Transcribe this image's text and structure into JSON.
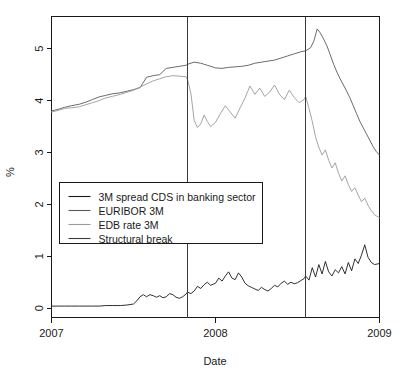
{
  "chart_data": {
    "type": "line",
    "title": "",
    "xlabel": "Date",
    "ylabel": "%",
    "xlim": [
      2007.0,
      2009.0
    ],
    "ylim": [
      -0.18,
      5.62
    ],
    "grid": false,
    "legend_position": "center-left",
    "x_tick_labels": [
      "2007",
      "2008",
      "2009"
    ],
    "x_tick_values": [
      2007,
      2008,
      2009
    ],
    "y_tick_labels": [
      "0",
      "1",
      "2",
      "3",
      "4",
      "5"
    ],
    "y_tick_values": [
      0,
      1,
      2,
      3,
      4,
      5
    ],
    "colors": {
      "cds": "#1a1a1a",
      "euribor": "#5a5a5a",
      "edb": "#9a9a9a",
      "break": "#3c3c3c",
      "axis": "#1a1a1a",
      "background": "#ffffff"
    },
    "annotations": [
      {
        "name": "structural-break-1",
        "x": 2007.83,
        "label": "Structural break"
      },
      {
        "name": "structural-break-2",
        "x": 2008.55,
        "label": "Structural break"
      }
    ],
    "series": [
      {
        "name": "3M spread CDS in banking sector",
        "key": "cds",
        "x": [
          2007.0,
          2007.04,
          2007.08,
          2007.12,
          2007.17,
          2007.21,
          2007.25,
          2007.29,
          2007.33,
          2007.37,
          2007.42,
          2007.46,
          2007.5,
          2007.52,
          2007.54,
          2007.56,
          2007.58,
          2007.6,
          2007.62,
          2007.64,
          2007.66,
          2007.68,
          2007.7,
          2007.72,
          2007.74,
          2007.76,
          2007.78,
          2007.8,
          2007.82,
          2007.83,
          2007.85,
          2007.87,
          2007.89,
          2007.91,
          2007.93,
          2007.95,
          2007.97,
          2008.0,
          2008.02,
          2008.04,
          2008.06,
          2008.08,
          2008.1,
          2008.12,
          2008.14,
          2008.16,
          2008.18,
          2008.2,
          2008.22,
          2008.24,
          2008.26,
          2008.28,
          2008.3,
          2008.32,
          2008.34,
          2008.36,
          2008.38,
          2008.4,
          2008.42,
          2008.44,
          2008.46,
          2008.48,
          2008.5,
          2008.52,
          2008.54,
          2008.55,
          2008.57,
          2008.59,
          2008.61,
          2008.63,
          2008.65,
          2008.67,
          2008.69,
          2008.71,
          2008.73,
          2008.75,
          2008.77,
          2008.79,
          2008.81,
          2008.83,
          2008.85,
          2008.87,
          2008.89,
          2008.91,
          2008.93,
          2008.95,
          2008.97,
          2009.0
        ],
        "values": [
          0.04,
          0.04,
          0.04,
          0.04,
          0.04,
          0.04,
          0.04,
          0.04,
          0.05,
          0.05,
          0.05,
          0.06,
          0.08,
          0.14,
          0.22,
          0.26,
          0.22,
          0.26,
          0.24,
          0.21,
          0.24,
          0.2,
          0.22,
          0.28,
          0.26,
          0.21,
          0.19,
          0.22,
          0.27,
          0.31,
          0.28,
          0.33,
          0.42,
          0.38,
          0.45,
          0.5,
          0.44,
          0.48,
          0.58,
          0.52,
          0.62,
          0.7,
          0.58,
          0.55,
          0.68,
          0.6,
          0.48,
          0.43,
          0.4,
          0.37,
          0.34,
          0.4,
          0.36,
          0.33,
          0.38,
          0.44,
          0.41,
          0.48,
          0.52,
          0.46,
          0.5,
          0.47,
          0.49,
          0.53,
          0.57,
          0.62,
          0.54,
          0.78,
          0.6,
          0.84,
          0.66,
          0.9,
          0.7,
          0.62,
          0.74,
          0.68,
          0.8,
          0.66,
          0.88,
          0.72,
          0.95,
          0.86,
          1.02,
          1.22,
          0.98,
          0.88,
          0.84,
          0.86
        ]
      },
      {
        "name": "EURIBOR  3M",
        "key": "euribor",
        "x": [
          2007.0,
          2007.04,
          2007.08,
          2007.12,
          2007.17,
          2007.21,
          2007.25,
          2007.29,
          2007.33,
          2007.37,
          2007.42,
          2007.46,
          2007.5,
          2007.54,
          2007.58,
          2007.62,
          2007.66,
          2007.7,
          2007.74,
          2007.78,
          2007.82,
          2007.83,
          2007.87,
          2007.91,
          2007.95,
          2008.0,
          2008.04,
          2008.08,
          2008.12,
          2008.16,
          2008.2,
          2008.24,
          2008.28,
          2008.32,
          2008.36,
          2008.4,
          2008.44,
          2008.48,
          2008.52,
          2008.55,
          2008.58,
          2008.6,
          2008.62,
          2008.64,
          2008.66,
          2008.68,
          2008.7,
          2008.72,
          2008.74,
          2008.76,
          2008.78,
          2008.8,
          2008.82,
          2008.84,
          2008.86,
          2008.88,
          2008.9,
          2008.92,
          2008.94,
          2008.96,
          2008.98,
          2009.0
        ],
        "values": [
          3.8,
          3.83,
          3.87,
          3.9,
          3.93,
          3.97,
          4.02,
          4.07,
          4.1,
          4.13,
          4.15,
          4.18,
          4.21,
          4.25,
          4.45,
          4.48,
          4.5,
          4.62,
          4.64,
          4.66,
          4.68,
          4.7,
          4.74,
          4.72,
          4.68,
          4.63,
          4.62,
          4.64,
          4.65,
          4.66,
          4.68,
          4.72,
          4.74,
          4.76,
          4.78,
          4.82,
          4.86,
          4.9,
          4.94,
          4.96,
          5.02,
          5.15,
          5.38,
          5.3,
          5.18,
          5.05,
          4.88,
          4.7,
          4.55,
          4.42,
          4.3,
          4.18,
          4.05,
          3.9,
          3.75,
          3.6,
          3.48,
          3.36,
          3.24,
          3.12,
          3.02,
          2.95
        ]
      },
      {
        "name": "EDB rate 3M",
        "key": "edb",
        "x": [
          2007.0,
          2007.04,
          2007.08,
          2007.12,
          2007.17,
          2007.21,
          2007.25,
          2007.29,
          2007.33,
          2007.37,
          2007.42,
          2007.46,
          2007.5,
          2007.54,
          2007.58,
          2007.62,
          2007.66,
          2007.7,
          2007.74,
          2007.78,
          2007.82,
          2007.83,
          2007.85,
          2007.87,
          2007.89,
          2007.91,
          2007.93,
          2007.95,
          2007.97,
          2008.0,
          2008.03,
          2008.06,
          2008.09,
          2008.12,
          2008.15,
          2008.18,
          2008.21,
          2008.24,
          2008.27,
          2008.3,
          2008.33,
          2008.36,
          2008.39,
          2008.42,
          2008.45,
          2008.48,
          2008.51,
          2008.54,
          2008.55,
          2008.57,
          2008.59,
          2008.61,
          2008.63,
          2008.65,
          2008.67,
          2008.69,
          2008.71,
          2008.73,
          2008.75,
          2008.77,
          2008.79,
          2008.81,
          2008.83,
          2008.85,
          2008.87,
          2008.89,
          2008.91,
          2008.93,
          2008.95,
          2008.97,
          2009.0
        ],
        "values": [
          3.78,
          3.81,
          3.85,
          3.86,
          3.88,
          3.92,
          3.96,
          4.0,
          4.05,
          4.08,
          4.12,
          4.16,
          4.2,
          4.26,
          4.32,
          4.38,
          4.42,
          4.46,
          4.48,
          4.47,
          4.46,
          4.4,
          4.14,
          3.62,
          3.48,
          3.55,
          3.72,
          3.6,
          3.5,
          3.58,
          3.75,
          3.9,
          3.78,
          3.66,
          3.86,
          4.05,
          4.28,
          4.12,
          4.24,
          4.08,
          4.16,
          4.3,
          4.12,
          4.02,
          4.2,
          4.06,
          3.96,
          4.02,
          4.08,
          3.85,
          3.6,
          3.3,
          3.1,
          2.95,
          3.05,
          2.85,
          2.7,
          2.8,
          2.6,
          2.45,
          2.55,
          2.38,
          2.25,
          2.32,
          2.18,
          2.05,
          2.12,
          1.98,
          1.88,
          1.8,
          1.74
        ]
      }
    ]
  },
  "legend": {
    "entries": [
      {
        "label": "3M spread CDS in banking sector",
        "key": "cds"
      },
      {
        "label": "EURIBOR  3M",
        "key": "euribor"
      },
      {
        "label": "EDB rate 3M",
        "key": "edb"
      },
      {
        "label": "Structural break",
        "key": "break"
      }
    ]
  }
}
